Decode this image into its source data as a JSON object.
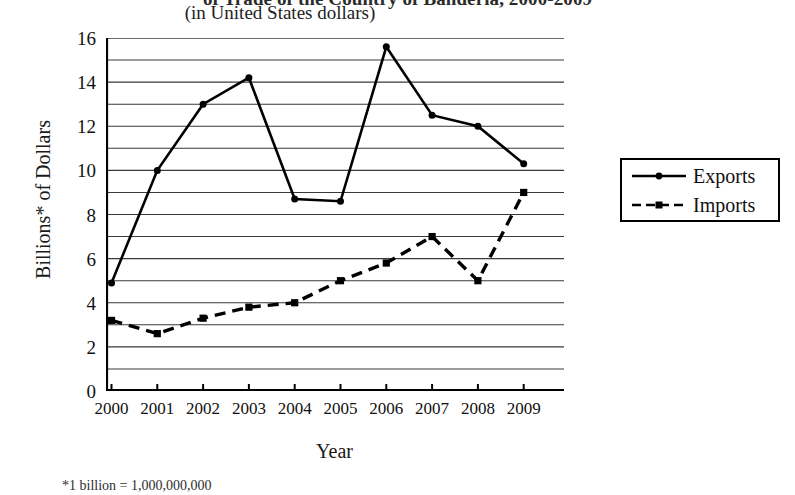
{
  "figure": {
    "title": "of Trade of the Country of Banderia, 2000-2009",
    "subtitle": "(in United States dollars)",
    "footnote": "*1 billion = 1,000,000,000"
  },
  "legend": {
    "items": [
      {
        "label": "Exports",
        "style": "solid-line-circle-marker"
      },
      {
        "label": "Imports",
        "style": "dashed-line-square-marker"
      }
    ]
  },
  "chart_data": {
    "type": "line",
    "title": "of Trade of the Country of Banderia, 2000-2009",
    "subtitle": "(in United States dollars)",
    "xlabel": "Year",
    "ylabel": "Billions* of Dollars",
    "categories": [
      "2000",
      "2001",
      "2002",
      "2003",
      "2004",
      "2005",
      "2006",
      "2007",
      "2008",
      "2009"
    ],
    "x_tick_labels": [
      "2000",
      "2001",
      "2002",
      "2003",
      "2004",
      "2005",
      "2006",
      "2007",
      "2008",
      "2009"
    ],
    "y_tick_labels": [
      "0",
      "2",
      "4",
      "6",
      "8",
      "10",
      "12",
      "14",
      "16"
    ],
    "y_tick_values": [
      0,
      2,
      4,
      6,
      8,
      10,
      12,
      14,
      16
    ],
    "ylim": [
      0,
      16
    ],
    "grid": "horizontal-every-1-unit",
    "gridline_values": [
      1,
      2,
      3,
      4,
      5,
      6,
      7,
      8,
      9,
      10,
      11,
      12,
      13,
      14,
      15,
      16
    ],
    "legend_position": "right-outside",
    "series": [
      {
        "name": "Exports",
        "color": "#000000",
        "line_style": "solid",
        "marker": "circle",
        "values": [
          4.9,
          10.0,
          13.0,
          14.2,
          8.7,
          8.6,
          15.6,
          12.5,
          12.0,
          10.3
        ]
      },
      {
        "name": "Imports",
        "color": "#000000",
        "line_style": "dashed",
        "marker": "square",
        "values": [
          3.2,
          2.6,
          3.3,
          3.8,
          4.0,
          5.0,
          5.8,
          7.0,
          5.0,
          9.0
        ]
      }
    ]
  }
}
